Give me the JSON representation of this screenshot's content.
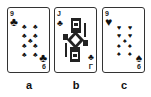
{
  "cards": [
    {
      "id": "a",
      "rank": "9",
      "suit": "clubs",
      "suit_glyph": "♣",
      "caption": "a",
      "corner_bottom": "6"
    },
    {
      "id": "b",
      "rank": "J",
      "suit": "clubs",
      "suit_glyph": "♣",
      "caption": "b",
      "corner_bottom": "Γ"
    },
    {
      "id": "c",
      "rank": "9",
      "suit": "spades-hearts",
      "suit_glyph": "♥",
      "bottom_glyph": "♠",
      "caption": "c",
      "corner_bottom": "6"
    }
  ]
}
